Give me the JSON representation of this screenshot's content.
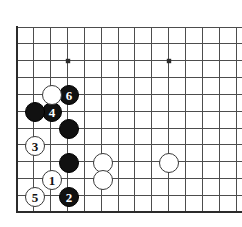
{
  "figure": {
    "kind": "go-board-diagram",
    "background_color": "#ffffff",
    "line_color": "#4d4d4d",
    "border_color": "#2b2b2b",
    "black_stone_color": "#111111",
    "white_stone_color": "#ffffff",
    "stone_outline_color": "#3a3a3a"
  },
  "board": {
    "left_edge_x": 17,
    "bottom_edge_y": 212,
    "top_line_y": 27,
    "spacing": 16.85,
    "columns": 14,
    "rows": 11,
    "star_points": [
      {
        "x": 68,
        "y": 61
      },
      {
        "x": 169,
        "y": 61
      }
    ]
  },
  "stones": [
    {
      "id": "white-1",
      "color": "white",
      "label": "1",
      "x": 52,
      "y": 180,
      "radius": 10
    },
    {
      "id": "black-2",
      "color": "black",
      "label": "2",
      "x": 69,
      "y": 197,
      "radius": 10
    },
    {
      "id": "white-3",
      "color": "white",
      "label": "3",
      "x": 35,
      "y": 146,
      "radius": 10
    },
    {
      "id": "black-4",
      "color": "black",
      "label": "4",
      "x": 52,
      "y": 112,
      "radius": 10
    },
    {
      "id": "white-5",
      "color": "white",
      "label": "5",
      "x": 35,
      "y": 197,
      "radius": 10
    },
    {
      "id": "black-6",
      "color": "black",
      "label": "6",
      "x": 69,
      "y": 95,
      "radius": 10
    },
    {
      "id": "white-a",
      "color": "white",
      "label": "",
      "x": 52,
      "y": 95,
      "radius": 10
    },
    {
      "id": "black-a",
      "color": "black",
      "label": "",
      "x": 35,
      "y": 112,
      "radius": 10
    },
    {
      "id": "black-b",
      "color": "black",
      "label": "",
      "x": 69,
      "y": 129,
      "radius": 10
    },
    {
      "id": "black-c",
      "color": "black",
      "label": "",
      "x": 69,
      "y": 163,
      "radius": 10
    },
    {
      "id": "white-b",
      "color": "white",
      "label": "",
      "x": 103,
      "y": 163,
      "radius": 10
    },
    {
      "id": "white-c",
      "color": "white",
      "label": "",
      "x": 103,
      "y": 180,
      "radius": 10
    },
    {
      "id": "white-d",
      "color": "white",
      "label": "",
      "x": 169,
      "y": 163,
      "radius": 10
    }
  ]
}
